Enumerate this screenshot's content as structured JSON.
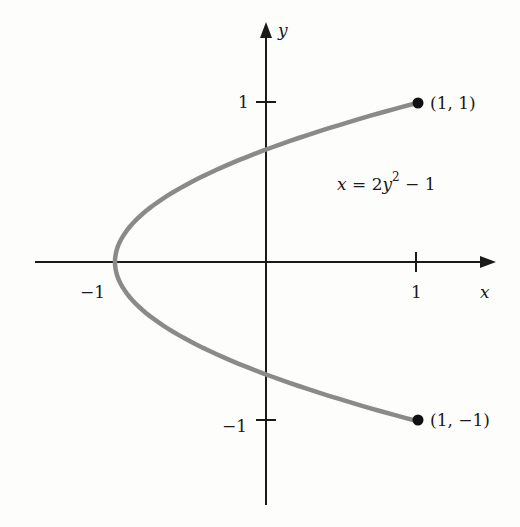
{
  "diagram": {
    "type": "parametric-curve-plot",
    "equation": {
      "lhs": "x",
      "eq": " = 2",
      "var": "y",
      "exp": "2",
      "rest": " − 1"
    },
    "axes": {
      "x_label": "x",
      "y_label": "y",
      "x_ticks": [
        {
          "value": -1,
          "label": "−1"
        },
        {
          "value": 1,
          "label": "1"
        }
      ],
      "y_ticks": [
        {
          "value": 1,
          "label": "1"
        },
        {
          "value": -1,
          "label": "−1"
        }
      ]
    },
    "points": [
      {
        "x": 1,
        "y": 1,
        "label": "(1, 1)"
      },
      {
        "x": 1,
        "y": -1,
        "label": "(1, −1)"
      }
    ],
    "curve": {
      "description": "x = 2y^2 - 1, for -1 <= y <= 1",
      "vertex": {
        "x": -1,
        "y": 0
      },
      "color": "#8a8a8a"
    },
    "colors": {
      "axis": "#1a1a1a",
      "curve": "#8a8a8a",
      "point": "#111111",
      "background": "#fdfdfb"
    }
  }
}
